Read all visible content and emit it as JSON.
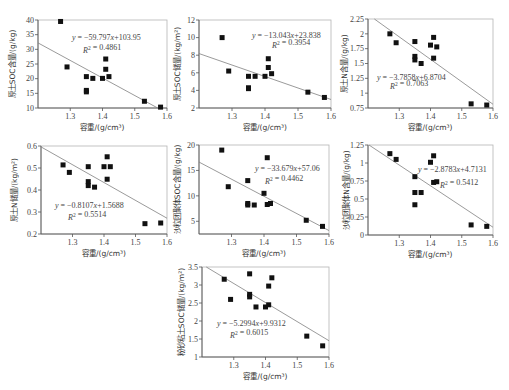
{
  "figure": {
    "panel_count": 7,
    "marker": "filled-square",
    "marker_color": "#111111",
    "fit_line_color": "#808080"
  },
  "chart_data": [
    {
      "type": "scatter",
      "title": "",
      "xlabel": "容重/(g/cm³)",
      "ylabel": "原土SOC含量/(g/kg)",
      "xlim": [
        1.2,
        1.6
      ],
      "ylim": [
        10,
        40
      ],
      "xticks": [
        "1.3",
        "1.4",
        "1.5",
        "1.6"
      ],
      "yticks": [
        "10",
        "15",
        "20",
        "25",
        "30",
        "35",
        "40"
      ],
      "points": [
        [
          1.27,
          39.5
        ],
        [
          1.29,
          24.0
        ],
        [
          1.35,
          20.7
        ],
        [
          1.35,
          16.0
        ],
        [
          1.35,
          15.5
        ],
        [
          1.37,
          20.1
        ],
        [
          1.4,
          20.1
        ],
        [
          1.41,
          26.7
        ],
        [
          1.41,
          23.2
        ],
        [
          1.42,
          20.7
        ],
        [
          1.53,
          12.3
        ],
        [
          1.58,
          10.3
        ]
      ],
      "fit": {
        "slope": -59.797,
        "intercept": 103.95
      },
      "equation": "y = −59.797x+103.95",
      "r2_text": "R² = 0.4861",
      "grid": false
    },
    {
      "type": "scatter",
      "title": "",
      "xlabel": "容重/(g/cm³)",
      "ylabel": "原土SOC储量/(kg/m²)",
      "xlim": [
        1.2,
        1.6
      ],
      "ylim": [
        2,
        12
      ],
      "xticks": [
        "1.3",
        "1.4",
        "1.5",
        "1.6"
      ],
      "yticks": [
        "2",
        "4",
        "6",
        "8",
        "10",
        "12"
      ],
      "points": [
        [
          1.27,
          10.0
        ],
        [
          1.29,
          6.2
        ],
        [
          1.35,
          5.6
        ],
        [
          1.35,
          4.3
        ],
        [
          1.35,
          4.2
        ],
        [
          1.37,
          5.6
        ],
        [
          1.4,
          5.6
        ],
        [
          1.41,
          7.6
        ],
        [
          1.41,
          6.6
        ],
        [
          1.42,
          5.9
        ],
        [
          1.53,
          3.8
        ],
        [
          1.58,
          3.2
        ]
      ],
      "fit": {
        "slope": -13.043,
        "intercept": 23.838
      },
      "equation": "y = −13.043x+23.838",
      "r2_text": "R² = 0.3954",
      "grid": false
    },
    {
      "type": "scatter",
      "title": "",
      "xlabel": "容重/(g/cm³)",
      "ylabel": "原土N含量/(g/kg)",
      "xlim": [
        1.2,
        1.6
      ],
      "ylim": [
        0.75,
        2.25
      ],
      "xticks": [
        "1.3",
        "1.4",
        "1.5",
        "1.6"
      ],
      "yticks": [
        "0.75",
        "1",
        "1.25",
        "1.5",
        "1.75",
        "2",
        "2.25"
      ],
      "points": [
        [
          1.27,
          2.0
        ],
        [
          1.29,
          1.85
        ],
        [
          1.35,
          1.87
        ],
        [
          1.35,
          1.62
        ],
        [
          1.35,
          1.56
        ],
        [
          1.37,
          1.5
        ],
        [
          1.4,
          1.81
        ],
        [
          1.41,
          1.94
        ],
        [
          1.41,
          1.59
        ],
        [
          1.42,
          1.78
        ],
        [
          1.53,
          0.82
        ],
        [
          1.58,
          0.8
        ]
      ],
      "fit": {
        "slope": -3.7858,
        "intercept": 6.8704
      },
      "equation": "y = −3.7858x+6.8704",
      "r2_text": "R² = 0.7063",
      "grid": false
    },
    {
      "type": "scatter",
      "title": "",
      "xlabel": "容重/(g/cm³)",
      "ylabel": "原土N储量/(kg/m²)",
      "xlim": [
        1.2,
        1.6
      ],
      "ylim": [
        0.2,
        0.6
      ],
      "xticks": [
        "1.3",
        "1.4",
        "1.5",
        "1.6"
      ],
      "yticks": [
        "0.2",
        "0.3",
        "0.4",
        "0.5",
        "0.6"
      ],
      "points": [
        [
          1.27,
          0.514
        ],
        [
          1.29,
          0.48
        ],
        [
          1.35,
          0.506
        ],
        [
          1.35,
          0.438
        ],
        [
          1.35,
          0.42
        ],
        [
          1.37,
          0.413
        ],
        [
          1.4,
          0.506
        ],
        [
          1.41,
          0.551
        ],
        [
          1.41,
          0.449
        ],
        [
          1.42,
          0.506
        ],
        [
          1.53,
          0.247
        ],
        [
          1.58,
          0.25
        ]
      ],
      "fit": {
        "slope": -0.8107,
        "intercept": 1.5688
      },
      "equation": "y = −0.8107x+1.5688",
      "r2_text": "R² = 0.5514",
      "grid": false
    },
    {
      "type": "scatter",
      "title": "",
      "xlabel": "容重/(g/cm³)",
      "ylabel": "沙粒团聚体SOC含量/(g/kg)",
      "xlim": [
        1.2,
        1.6
      ],
      "ylim": [
        2.5,
        20
      ],
      "xticks": [
        "1.3",
        "1.4",
        "1.5",
        "1.6"
      ],
      "yticks": [
        "5",
        "10",
        "15",
        "20"
      ],
      "points": [
        [
          1.27,
          19.0
        ],
        [
          1.29,
          11.8
        ],
        [
          1.35,
          13.0
        ],
        [
          1.35,
          8.5
        ],
        [
          1.35,
          8.2
        ],
        [
          1.37,
          8.2
        ],
        [
          1.4,
          10.5
        ],
        [
          1.41,
          17.5
        ],
        [
          1.41,
          8.3
        ],
        [
          1.42,
          8.5
        ],
        [
          1.53,
          5.2
        ],
        [
          1.58,
          4.0
        ]
      ],
      "fit": {
        "slope": -33.679,
        "intercept": 57.06
      },
      "equation": "y = −33.679x+57.06",
      "r2_text": "R² = 0.4462",
      "grid": false
    },
    {
      "type": "scatter",
      "title": "",
      "xlabel": "容重/(g/cm³)",
      "ylabel": "沙粒团聚体N含量/(g/kg)",
      "xlim": [
        1.2,
        1.6
      ],
      "ylim": [
        0,
        1.25
      ],
      "xticks": [
        "1.3",
        "1.4",
        "1.5",
        "1.6"
      ],
      "yticks": [
        "0",
        "0.25",
        "0.5",
        "0.75",
        "1",
        "1.25"
      ],
      "points": [
        [
          1.27,
          1.13
        ],
        [
          1.29,
          1.05
        ],
        [
          1.35,
          0.81
        ],
        [
          1.35,
          0.59
        ],
        [
          1.35,
          0.42
        ],
        [
          1.37,
          0.59
        ],
        [
          1.4,
          1.01
        ],
        [
          1.41,
          1.1
        ],
        [
          1.41,
          0.73
        ],
        [
          1.42,
          0.74
        ],
        [
          1.53,
          0.14
        ],
        [
          1.58,
          0.12
        ]
      ],
      "fit": {
        "slope": -2.8783,
        "intercept": 4.7131
      },
      "equation": "y = −2.8783x+4.7131",
      "r2_text": "R² = 0.5412",
      "grid": false
    },
    {
      "type": "scatter",
      "title": "",
      "xlabel": "容重/(g/cm³)",
      "ylabel": "粉砂粘土SOC储量/(kg/m²)",
      "xlim": [
        1.2,
        1.6
      ],
      "ylim": [
        1,
        3.5
      ],
      "xticks": [
        "1.3",
        "1.4",
        "1.5",
        "1.6"
      ],
      "yticks": [
        "1",
        "1.5",
        "2",
        "2.5",
        "3",
        "3.5"
      ],
      "points": [
        [
          1.27,
          3.16
        ],
        [
          1.29,
          2.6
        ],
        [
          1.35,
          3.31
        ],
        [
          1.35,
          2.74
        ],
        [
          1.35,
          2.67
        ],
        [
          1.37,
          2.39
        ],
        [
          1.4,
          2.39
        ],
        [
          1.41,
          2.45
        ],
        [
          1.41,
          2.97
        ],
        [
          1.42,
          3.2
        ],
        [
          1.53,
          1.58
        ],
        [
          1.58,
          1.31
        ]
      ],
      "fit": {
        "slope": -5.2994,
        "intercept": 9.9312
      },
      "equation": "y = −5.2994x+9.9312",
      "r2_text": "R² = 0.6015",
      "grid": false
    }
  ]
}
